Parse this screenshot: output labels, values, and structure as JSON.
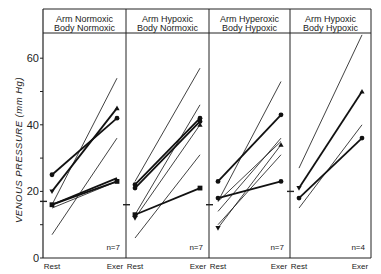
{
  "chart_data": {
    "type": "line",
    "title": "",
    "ylabel": "VENOUS PRESSURE (mm Hg)",
    "xlabel": "",
    "ylim": [
      0,
      70
    ],
    "yticks": [
      0,
      20,
      40,
      60
    ],
    "grid": false,
    "categories": [
      "Rest",
      "Exer"
    ],
    "panels": [
      {
        "title_line1": "Arm  Normoxic",
        "title_line2": "Body  Normoxic",
        "n_label": "n=7",
        "mean_rest": 17,
        "series": [
          {
            "rest": 25,
            "exer": 42,
            "style": "thick",
            "marker": "dot"
          },
          {
            "rest": 20,
            "exer": 45,
            "style": "thick",
            "marker": "triangle"
          },
          {
            "rest": 16,
            "exer": 23,
            "style": "thick",
            "marker": "square"
          },
          {
            "rest": 16,
            "exer": 24,
            "style": "thick",
            "marker": "none"
          },
          {
            "rest": 15,
            "exer": 23,
            "style": "thin",
            "marker": "none"
          },
          {
            "rest": 16,
            "exer": 54,
            "style": "thin",
            "marker": "none"
          },
          {
            "rest": 7,
            "exer": 36,
            "style": "thin",
            "marker": "none"
          }
        ]
      },
      {
        "title_line1": "Arm  Hypoxic",
        "title_line2": "Body  Normoxic",
        "n_label": "n=7",
        "mean_rest": 16,
        "series": [
          {
            "rest": 22,
            "exer": 42,
            "style": "thick",
            "marker": "dot"
          },
          {
            "rest": 21,
            "exer": 41,
            "style": "thick",
            "marker": "dot"
          },
          {
            "rest": 13,
            "exer": 21,
            "style": "thick",
            "marker": "square"
          },
          {
            "rest": 12,
            "exer": 40,
            "style": "thin",
            "marker": "triangle"
          },
          {
            "rest": 13,
            "exer": 46,
            "style": "thin",
            "marker": "none"
          },
          {
            "rest": 23,
            "exer": 57,
            "style": "thin",
            "marker": "none"
          },
          {
            "rest": 6,
            "exer": 31,
            "style": "thin",
            "marker": "none"
          }
        ]
      },
      {
        "title_line1": "Arm  Hyperoxic",
        "title_line2": "Body  Hypoxic",
        "n_label": "n=7",
        "mean_rest": 16,
        "series": [
          {
            "rest": 23,
            "exer": 43,
            "style": "thick",
            "marker": "dot"
          },
          {
            "rest": 18,
            "exer": 23,
            "style": "thick",
            "marker": "dot"
          },
          {
            "rest": 17,
            "exer": 53,
            "style": "thin",
            "marker": "none"
          },
          {
            "rest": 17,
            "exer": 35,
            "style": "thin",
            "marker": "none"
          },
          {
            "rest": 14,
            "exer": 36,
            "style": "thin",
            "marker": "none"
          },
          {
            "rest": 10,
            "exer": 31,
            "style": "thin",
            "marker": "none"
          },
          {
            "rest": 9,
            "exer": 34,
            "style": "thin",
            "marker": "triangle"
          }
        ]
      },
      {
        "title_line1": "Arm  Hypoxic",
        "title_line2": "Body  Hypoxic",
        "n_label": "n=4",
        "mean_rest": 20,
        "series": [
          {
            "rest": 21,
            "exer": 50,
            "style": "thick",
            "marker": "triangle"
          },
          {
            "rest": 18,
            "exer": 36,
            "style": "thick",
            "marker": "dot"
          },
          {
            "rest": 27,
            "exer": 67,
            "style": "thin",
            "marker": "none"
          },
          {
            "rest": 15,
            "exer": 40,
            "style": "thin",
            "marker": "none"
          }
        ]
      }
    ]
  },
  "axis": {
    "ylabel": "VENOUS PRESSURE (mm Hg)",
    "ticks": [
      "0",
      "20",
      "40",
      "60"
    ],
    "rest_label": "Rest",
    "exer_label": "Exer"
  }
}
